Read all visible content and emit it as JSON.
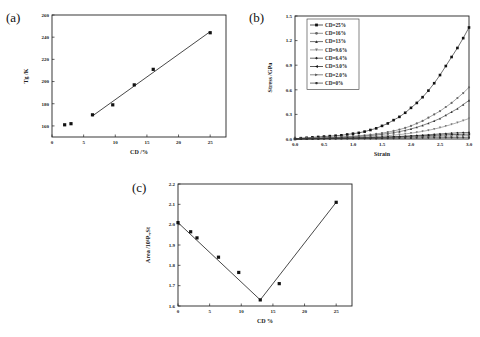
{
  "chart_data": [
    {
      "type": "scatter",
      "panel_label": "(a)",
      "title": "",
      "xlabel": "CD /%",
      "ylabel": "Tg /K",
      "xlim": [
        0,
        27.5
      ],
      "ylim": [
        150,
        260
      ],
      "xticks": [
        0,
        5,
        10,
        15,
        20,
        25
      ],
      "yticks": [
        160,
        180,
        200,
        220,
        240,
        260
      ],
      "grid": false,
      "series": [
        {
          "name": "Tg",
          "marker": "square",
          "x": [
            2.0,
            3.0,
            6.4,
            9.6,
            13,
            16,
            25
          ],
          "y": [
            161,
            162,
            170,
            179,
            197,
            211,
            244
          ]
        }
      ],
      "fit_line": {
        "x": [
          6.4,
          25
        ],
        "y": [
          169,
          245
        ]
      }
    },
    {
      "type": "line",
      "panel_label": "(b)",
      "title": "",
      "xlabel": "Strain",
      "ylabel": "Stress /GPa",
      "xlim": [
        0,
        3.0
      ],
      "ylim": [
        0,
        1.5
      ],
      "xticks": [
        0.0,
        0.5,
        1.0,
        1.5,
        2.0,
        2.5,
        3.0
      ],
      "yticks": [
        0.0,
        0.3,
        0.6,
        0.9,
        1.2,
        1.5
      ],
      "grid": false,
      "legend_position": "top-left",
      "x": [
        0.0,
        0.1,
        0.2,
        0.3,
        0.4,
        0.5,
        0.6,
        0.7,
        0.8,
        0.9,
        1.0,
        1.1,
        1.2,
        1.3,
        1.4,
        1.5,
        1.6,
        1.7,
        1.8,
        1.9,
        2.0,
        2.1,
        2.2,
        2.3,
        2.4,
        2.5,
        2.6,
        2.7,
        2.8,
        2.9,
        3.0
      ],
      "series": [
        {
          "name": "CD=25%",
          "marker": "square",
          "color": "#111111",
          "values": [
            0.0,
            0.01,
            0.015,
            0.02,
            0.025,
            0.03,
            0.035,
            0.04,
            0.045,
            0.055,
            0.065,
            0.075,
            0.09,
            0.11,
            0.13,
            0.16,
            0.19,
            0.23,
            0.27,
            0.32,
            0.38,
            0.44,
            0.51,
            0.59,
            0.68,
            0.78,
            0.89,
            1.0,
            1.11,
            1.23,
            1.36
          ]
        },
        {
          "name": "CD=16%",
          "marker": "circle",
          "color": "#666666",
          "values": [
            0.0,
            0.005,
            0.008,
            0.01,
            0.013,
            0.016,
            0.019,
            0.022,
            0.026,
            0.03,
            0.035,
            0.04,
            0.046,
            0.053,
            0.062,
            0.072,
            0.084,
            0.098,
            0.115,
            0.135,
            0.16,
            0.19,
            0.22,
            0.26,
            0.3,
            0.34,
            0.39,
            0.44,
            0.5,
            0.56,
            0.63
          ]
        },
        {
          "name": "CD=13%",
          "marker": "triangle-up",
          "color": "#333333",
          "values": [
            0.0,
            0.004,
            0.006,
            0.008,
            0.01,
            0.012,
            0.014,
            0.017,
            0.02,
            0.023,
            0.027,
            0.031,
            0.036,
            0.042,
            0.049,
            0.057,
            0.066,
            0.077,
            0.09,
            0.105,
            0.123,
            0.143,
            0.166,
            0.192,
            0.22,
            0.25,
            0.29,
            0.33,
            0.37,
            0.42,
            0.47
          ]
        },
        {
          "name": "CD=9.6%",
          "marker": "triangle-down",
          "color": "#777777",
          "values": [
            0.0,
            0.003,
            0.004,
            0.005,
            0.006,
            0.008,
            0.009,
            0.011,
            0.013,
            0.015,
            0.017,
            0.02,
            0.023,
            0.027,
            0.031,
            0.036,
            0.041,
            0.047,
            0.054,
            0.062,
            0.071,
            0.081,
            0.093,
            0.106,
            0.121,
            0.138,
            0.157,
            0.178,
            0.2,
            0.225,
            0.25
          ]
        },
        {
          "name": "CD=6.4%",
          "marker": "diamond",
          "color": "#222222",
          "values": [
            0.0,
            0.002,
            0.003,
            0.004,
            0.005,
            0.006,
            0.007,
            0.008,
            0.009,
            0.01,
            0.012,
            0.014,
            0.016,
            0.018,
            0.02,
            0.022,
            0.025,
            0.028,
            0.031,
            0.035,
            0.039,
            0.043,
            0.047,
            0.052,
            0.057,
            0.062,
            0.067,
            0.071,
            0.075,
            0.078,
            0.08
          ]
        },
        {
          "name": "CD=3.0%",
          "marker": "triangle-left",
          "color": "#111111",
          "values": [
            0.0,
            0.002,
            0.003,
            0.004,
            0.005,
            0.006,
            0.007,
            0.008,
            0.009,
            0.01,
            0.011,
            0.012,
            0.014,
            0.016,
            0.018,
            0.02,
            0.022,
            0.024,
            0.027,
            0.03,
            0.033,
            0.036,
            0.039,
            0.042,
            0.045,
            0.048,
            0.051,
            0.054,
            0.056,
            0.058,
            0.06
          ]
        },
        {
          "name": "CD=2.0%",
          "marker": "triangle-right",
          "color": "#555555",
          "values": [
            0.0,
            0.001,
            0.002,
            0.003,
            0.004,
            0.005,
            0.006,
            0.007,
            0.008,
            0.009,
            0.01,
            0.011,
            0.012,
            0.013,
            0.014,
            0.015,
            0.016,
            0.018,
            0.02,
            0.022,
            0.024,
            0.026,
            0.028,
            0.03,
            0.032,
            0.034,
            0.035,
            0.036,
            0.038,
            0.039,
            0.04
          ]
        },
        {
          "name": "CD=0%",
          "marker": "hexagon",
          "color": "#333333",
          "values": [
            0.0,
            0.001,
            0.001,
            0.002,
            0.002,
            0.003,
            0.003,
            0.004,
            0.004,
            0.005,
            0.005,
            0.006,
            0.006,
            0.007,
            0.007,
            0.008,
            0.009,
            0.01,
            0.011,
            0.012,
            0.013,
            0.014,
            0.015,
            0.016,
            0.017,
            0.017,
            0.018,
            0.018,
            0.019,
            0.019,
            0.02
          ]
        }
      ]
    },
    {
      "type": "scatter",
      "panel_label": "(c)",
      "title": "",
      "xlabel": "CD %",
      "ylabel": "Area /10⁶Pₐ,St",
      "xlim": [
        0,
        27.5
      ],
      "ylim": [
        1.6,
        2.2
      ],
      "xticks": [
        0,
        5,
        10,
        15,
        20,
        25
      ],
      "yticks": [
        1.6,
        1.7,
        1.8,
        1.9,
        2.0,
        2.1,
        2.2
      ],
      "grid": false,
      "series": [
        {
          "name": "Area",
          "marker": "square",
          "x": [
            0,
            2.0,
            3.0,
            6.4,
            9.6,
            13,
            16,
            25
          ],
          "y": [
            2.01,
            1.965,
            1.935,
            1.84,
            1.765,
            1.63,
            1.71,
            2.11
          ]
        }
      ],
      "fit_line": {
        "x": [
          0,
          13,
          25
        ],
        "y": [
          2.01,
          1.63,
          2.11
        ]
      }
    }
  ],
  "caption": ""
}
